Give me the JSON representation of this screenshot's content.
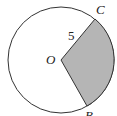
{
  "diagram": {
    "type": "circle-sector",
    "circle": {
      "center_label": "O",
      "cx": 61,
      "cy": 60,
      "r": 53
    },
    "points": {
      "O": {
        "label": "O",
        "x": 61,
        "y": 60
      },
      "C": {
        "label": "C",
        "x": 95,
        "y": 19
      },
      "B": {
        "label": "B",
        "x": 87,
        "y": 106
      }
    },
    "radius_label": "5",
    "shaded_region": "sector OCB",
    "colors": {
      "stroke": "#333333",
      "fill": "#b5b5b5",
      "background": "#ffffff"
    }
  }
}
